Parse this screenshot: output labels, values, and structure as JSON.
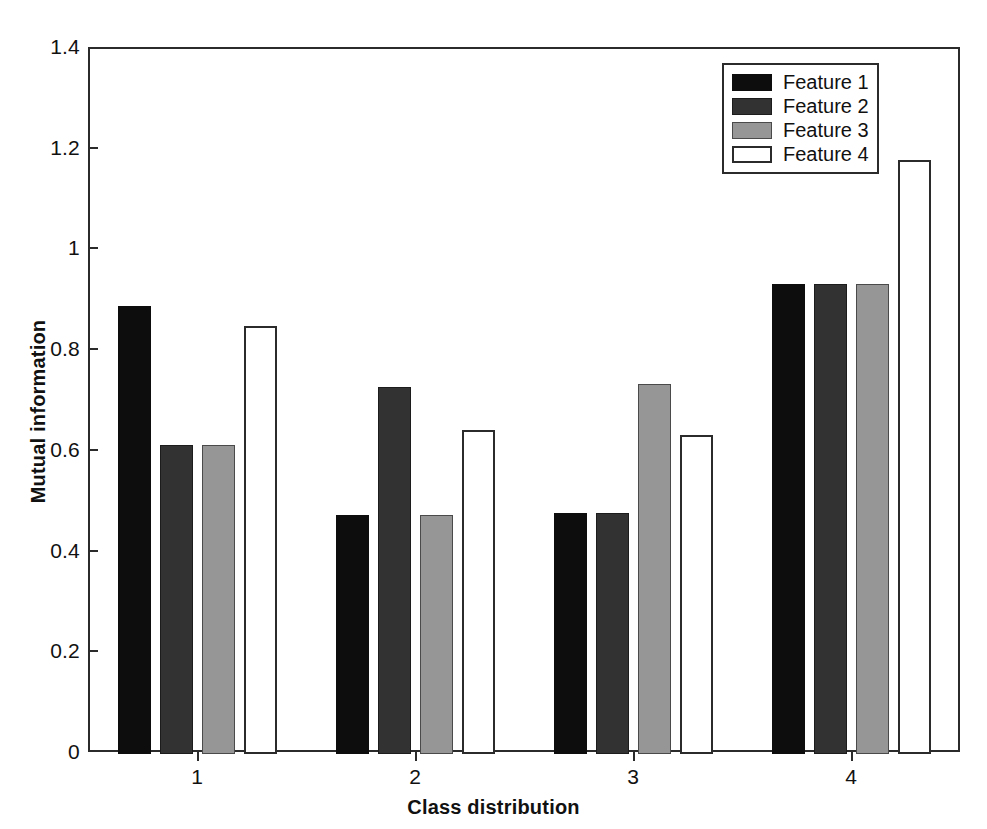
{
  "chart_data": {
    "type": "bar",
    "title": "",
    "xlabel": "Class distribution",
    "ylabel": "Mutual information",
    "categories": [
      "1",
      "2",
      "3",
      "4"
    ],
    "series": [
      {
        "name": "Feature 1",
        "color": "#0d0d0d",
        "values": [
          0.885,
          0.47,
          0.475,
          0.93
        ]
      },
      {
        "name": "Feature 2",
        "color": "#323232",
        "values": [
          0.61,
          0.725,
          0.475,
          0.93
        ]
      },
      {
        "name": "Feature 3",
        "color": "#969696",
        "values": [
          0.61,
          0.47,
          0.73,
          0.93
        ]
      },
      {
        "name": "Feature 4",
        "color": "#ffffff",
        "values": [
          0.845,
          0.64,
          0.63,
          1.175
        ]
      }
    ],
    "ylim": [
      0,
      1.4
    ],
    "yticks": [
      0,
      0.2,
      0.4,
      0.6,
      0.8,
      1,
      1.2,
      1.4
    ],
    "ytick_labels": [
      "0",
      "0.2",
      "0.4",
      "0.6",
      "0.8",
      "1",
      "1.2",
      "1.4"
    ],
    "xtick_labels": [
      "1",
      "2",
      "3",
      "4"
    ],
    "grid": false,
    "legend_position": "top-right",
    "legend_entries": [
      "Feature 1",
      "Feature 2",
      "Feature 3",
      "Feature 4"
    ]
  }
}
